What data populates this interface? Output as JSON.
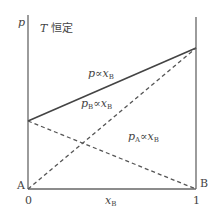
{
  "diagram": {
    "title": "T 恒定",
    "title_var": "T",
    "title_text": "恒定",
    "y_axis_label": "p",
    "x_axis_label": "x",
    "x_axis_sub": "B",
    "x_ticks": [
      "0",
      "1"
    ],
    "corner_labels": {
      "left": "A",
      "right": "B"
    },
    "lines": [
      {
        "name": "total-pressure",
        "label_var": "p",
        "label_sub": "",
        "label_rel": "∝",
        "label_x": "x",
        "label_x_sub": "B",
        "style": "solid",
        "from": [
          0,
          0.4
        ],
        "to": [
          1,
          0.82
        ]
      },
      {
        "name": "partial-pressure-B",
        "label_var": "p",
        "label_sub": "B",
        "label_rel": "∝",
        "label_x": "x",
        "label_x_sub": "B",
        "style": "dashed",
        "from": [
          0,
          0
        ],
        "to": [
          1,
          0.82
        ]
      },
      {
        "name": "partial-pressure-A",
        "label_var": "p",
        "label_sub": "A",
        "label_rel": "∝",
        "label_x": "x",
        "label_x_sub": "B",
        "style": "dashed",
        "from": [
          0,
          0.4
        ],
        "to": [
          1,
          0
        ]
      }
    ],
    "colors": {
      "line": "#444444",
      "axis": "#666666"
    }
  }
}
